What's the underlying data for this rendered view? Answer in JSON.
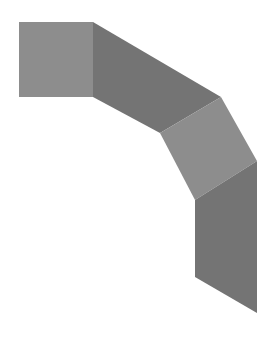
{
  "diagram": {
    "width": 277,
    "height": 340,
    "background": "#ffffff",
    "segments": [
      {
        "name": "segment-1-square",
        "fill": "#8d8d8d",
        "points": "19,22 93,22 93,97 19,97"
      },
      {
        "name": "segment-2-diagonal",
        "fill": "#747474",
        "points": "93,22 221,97 160,133 93,97"
      },
      {
        "name": "segment-3-diagonal",
        "fill": "#8d8d8d",
        "points": "221,97 257,161 195,200 160,133"
      },
      {
        "name": "segment-4-vertical",
        "fill": "#747474",
        "points": "257,161 257,313 195,277 195,200"
      }
    ]
  }
}
